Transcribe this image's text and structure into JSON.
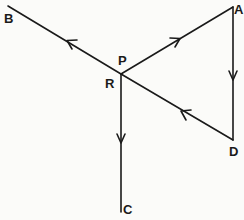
{
  "diagram": {
    "type": "vector-path-diagram",
    "stroke_color": "#1a1a1a",
    "background_color": "#fbfbf9",
    "nodes": [
      {
        "id": "B",
        "label": "B",
        "x": 8,
        "y": 6
      },
      {
        "id": "A",
        "label": "A",
        "x": 233,
        "y": 7
      },
      {
        "id": "P",
        "label": "P",
        "x": 121,
        "y": 74
      },
      {
        "id": "R",
        "label": "R",
        "x": 121,
        "y": 74
      },
      {
        "id": "D",
        "label": "D",
        "x": 233,
        "y": 140
      },
      {
        "id": "C",
        "label": "C",
        "x": 121,
        "y": 212
      }
    ],
    "edges": [
      {
        "from": "P",
        "to": "B",
        "arrow": "toward B"
      },
      {
        "from": "P",
        "to": "A",
        "arrow": "toward A"
      },
      {
        "from": "A",
        "to": "D",
        "arrow": "toward D"
      },
      {
        "from": "D",
        "to": "P",
        "arrow": "toward P"
      },
      {
        "from": "R",
        "to": "C",
        "arrow": "toward C"
      }
    ]
  },
  "labels": {
    "b": "B",
    "a": "A",
    "p": "P",
    "r": "R",
    "d": "D",
    "c": "C"
  }
}
